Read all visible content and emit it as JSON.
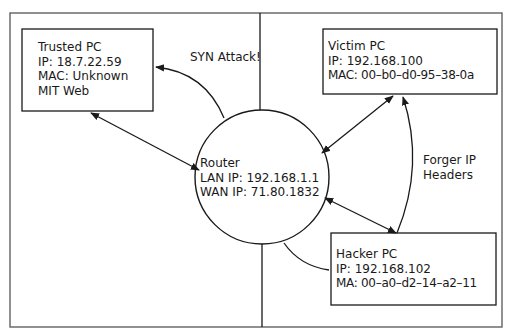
{
  "diagram": {
    "title": "",
    "nodes": {
      "trusted_pc": {
        "lines": [
          "Trusted PC",
          "IP: 18.7.22.59",
          "MAC: Unknown",
          "MIT Web"
        ]
      },
      "victim_pc": {
        "lines": [
          "Victim PC",
          "IP: 192.168.100",
          "MAC: 00–b0–d0-95–38-0a"
        ]
      },
      "router": {
        "lines": [
          "Router",
          "LAN IP: 192.168.1.1",
          "WAN IP: 71.80.1832"
        ]
      },
      "hacker_pc": {
        "lines": [
          "Hacker PC",
          "IP: 192.168.102",
          "MA: 00–a0–d2–14–a2–11"
        ]
      }
    },
    "edge_labels": {
      "syn_attack": "SYN Attack!",
      "forger_ip_1": "Forger IP",
      "forger_ip_2": "Headers"
    },
    "colors": {
      "stroke": "#1a1a1a",
      "frame": "#555555",
      "background": "#ffffff"
    }
  }
}
